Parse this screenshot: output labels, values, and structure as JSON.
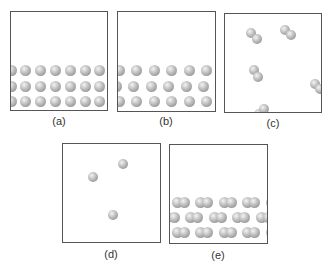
{
  "panels": [
    {
      "id": "a",
      "label": "(a)",
      "description": "solid of single atoms, close-packed rows"
    },
    {
      "id": "b",
      "label": "(b)",
      "description": "liquid/solid of single atoms, less ordered rows"
    },
    {
      "id": "c",
      "label": "(c)",
      "description": "gas of diatomic molecules"
    },
    {
      "id": "d",
      "label": "(d)",
      "description": "gas of single atoms"
    },
    {
      "id": "e",
      "label": "(e)",
      "description": "solid of diatomic molecules in rows"
    }
  ],
  "colors": {
    "atom": "#a8a8a8",
    "border": "#555555"
  }
}
